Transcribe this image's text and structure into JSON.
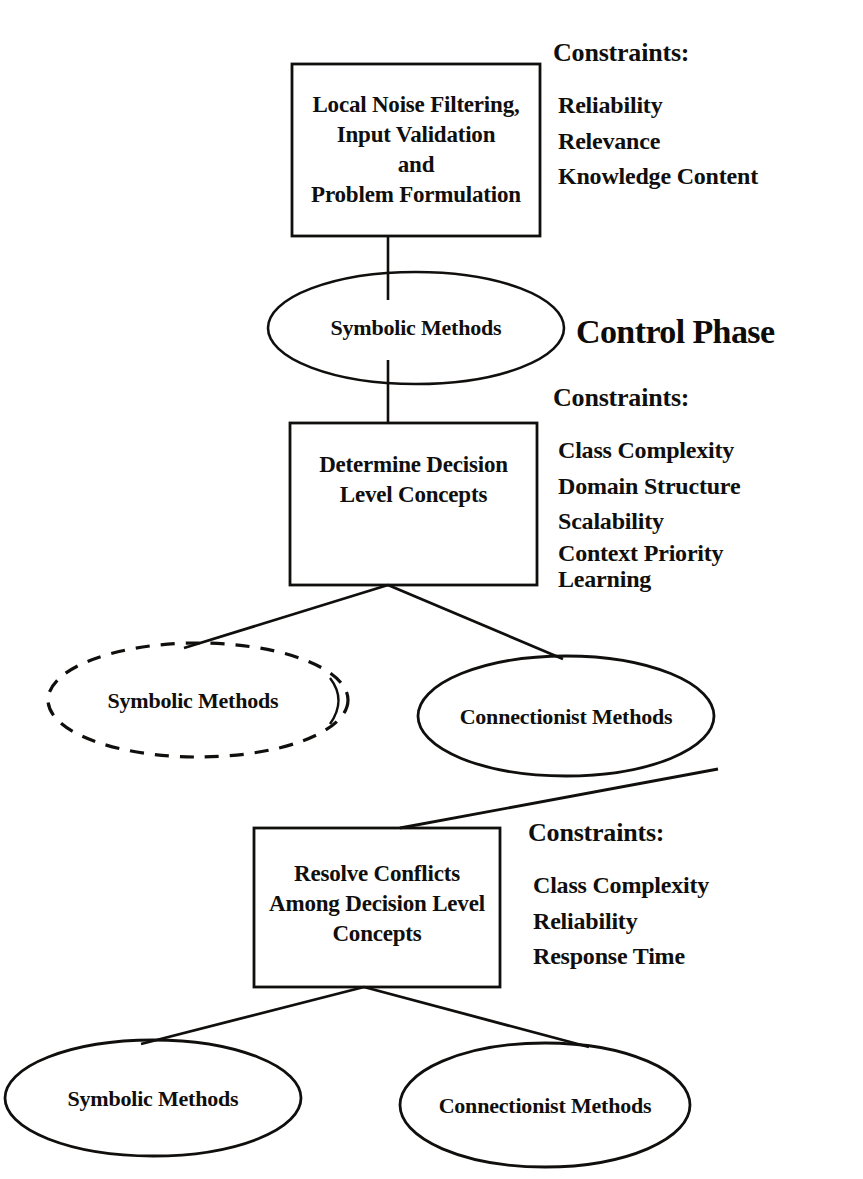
{
  "title": "Control Phase",
  "phase_title": "Control Phase",
  "ink_color": "#100f0d",
  "background_color": "#ffffff",
  "nodes": {
    "box_top": {
      "lines": [
        "Local Noise Filtering,",
        "Input Validation",
        "and",
        "Problem Formulation"
      ],
      "text": "Local Noise Filtering, Input Validation and Problem Formulation",
      "shape": "rectangle"
    },
    "ellipse_symbolic_1": {
      "label": "Symbolic Methods",
      "shape": "ellipse",
      "style": "solid"
    },
    "box_middle": {
      "lines": [
        "Determine Decision",
        "Level Concepts"
      ],
      "text": "Determine Decision Level Concepts",
      "shape": "rectangle"
    },
    "ellipse_symbolic_2": {
      "label": "Symbolic Methods",
      "shape": "ellipse",
      "style": "dashed"
    },
    "ellipse_connectionist_1": {
      "label": "Connectionist Methods",
      "shape": "ellipse",
      "style": "solid"
    },
    "box_bottom": {
      "lines": [
        "Resolve Conflicts",
        "Among Decision Level",
        "Concepts"
      ],
      "text": "Resolve Conflicts Among Decision Level Concepts",
      "shape": "rectangle"
    },
    "ellipse_symbolic_3": {
      "label": "Symbolic Methods",
      "shape": "ellipse",
      "style": "solid"
    },
    "ellipse_connectionist_2": {
      "label": "Connectionist Methods",
      "shape": "ellipse",
      "style": "solid"
    }
  },
  "constraints_groups": [
    {
      "heading": "Constraints:",
      "items": [
        "Reliability",
        "Relevance",
        "Knowledge Content"
      ]
    },
    {
      "heading": "Constraints:",
      "items": [
        "Class Complexity",
        "Domain Structure",
        "Scalability"
      ],
      "tight_items": [
        "Context Priority",
        "Learning"
      ]
    },
    {
      "heading": "Constraints:",
      "items": [
        "Class Complexity",
        "Reliability",
        "Response Time"
      ]
    }
  ]
}
